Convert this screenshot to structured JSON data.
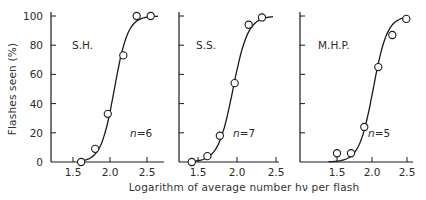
{
  "chart_data": {
    "type": "scatter",
    "title": "",
    "xlabel": "Logarithm of average number hν per flash",
    "ylabel": "Flashes seen (%)",
    "ylim": [
      0,
      100
    ],
    "yticks": [
      0,
      20,
      40,
      60,
      80,
      100
    ],
    "xticks": [
      1.5,
      2.0,
      2.5
    ],
    "xtick_labels": [
      "1.5",
      "2.0",
      "2.5"
    ],
    "grid": false,
    "legend": null,
    "panels": [
      {
        "subject": "S.H.",
        "n_label": "n=6",
        "n": 6,
        "x": [
          1.61,
          1.8,
          1.97,
          2.18,
          2.36,
          2.55
        ],
        "y": [
          0,
          9,
          33,
          73,
          100,
          100
        ],
        "fit_curve": "sigmoid (Poisson cumulative)"
      },
      {
        "subject": "S.S.",
        "n_label": "n=7",
        "n": 7,
        "x": [
          1.42,
          1.62,
          1.78,
          1.97,
          2.15,
          2.32
        ],
        "y": [
          0,
          4,
          18,
          54,
          94,
          99
        ],
        "fit_curve": "sigmoid (Poisson cumulative)"
      },
      {
        "subject": "M.H.P.",
        "n_label": "n=5",
        "n": 5,
        "x": [
          1.5,
          1.7,
          1.89,
          2.09,
          2.29,
          2.49
        ],
        "y": [
          6,
          6,
          24,
          65,
          87,
          98
        ],
        "fit_curve": "sigmoid (Poisson cumulative)"
      }
    ]
  },
  "colors": {
    "ink": "#1a1a1a",
    "text": "#2a2a2a",
    "background": "#ffffff"
  }
}
